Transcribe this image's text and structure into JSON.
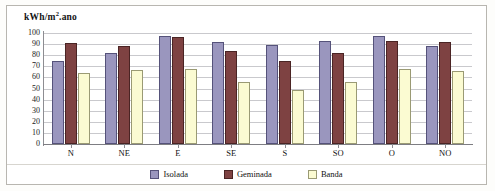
{
  "chart_data": {
    "type": "bar",
    "title_base": "kWh/m",
    "title_sup": "2",
    "title_tail": ".ano",
    "xlabel": "",
    "ylabel": "kWh/m².ano",
    "ylim": [
      0,
      100
    ],
    "yticks": [
      100,
      90,
      80,
      70,
      60,
      50,
      40,
      30,
      20,
      10,
      0
    ],
    "grid": true,
    "legend_position": "bottom",
    "categories": [
      "N",
      "NE",
      "E",
      "SE",
      "S",
      "SO",
      "O",
      "NO"
    ],
    "series": [
      {
        "name": "Isolada",
        "color": "#9a96be",
        "values": [
          75,
          82,
          97,
          92,
          89,
          93,
          97,
          88
        ]
      },
      {
        "name": "Geminada",
        "color": "#7e4242",
        "values": [
          91,
          88,
          96,
          84,
          75,
          82,
          93,
          92
        ]
      },
      {
        "name": "Banda",
        "color": "#fbfbd2",
        "values": [
          64,
          67,
          68,
          56,
          49,
          56,
          68,
          66
        ]
      }
    ]
  }
}
